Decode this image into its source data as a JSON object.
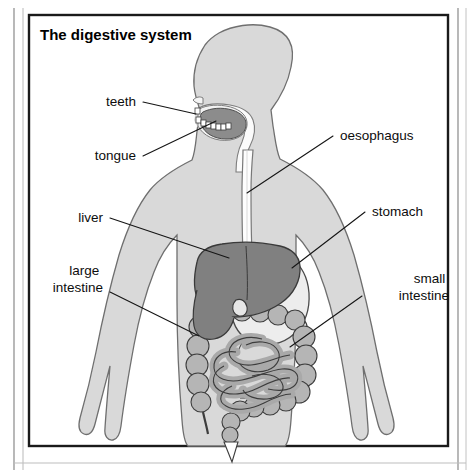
{
  "figure": {
    "title": "The digestive system",
    "background_color": "#ffffff",
    "frame_color": "#1a1a1a",
    "outer_rule_color": "#8a8a8a"
  },
  "palette": {
    "body_fill": "#d9d9d9",
    "body_stroke": "#6f6f6f",
    "liver_fill": "#808080",
    "liver_stroke": "#3a3a3a",
    "stomach_fill": "#ededed",
    "stomach_stroke": "#4a4a4a",
    "oesophagus_fill": "#fdfdfd",
    "oesophagus_stroke": "#787878",
    "intestine_fill": "#b5b5b5",
    "intestine_stroke": "#3d3d3d",
    "small_intestine_fill": "#a9a9a9",
    "tongue_fill": "#8a8a8a",
    "mouth_fill": "#f6f6f6",
    "teeth_fill": "#ffffff",
    "label_color": "#0d0d0d",
    "leader_color": "#151515"
  },
  "labels": [
    {
      "id": "teeth",
      "text": "teeth",
      "lines": [
        "teeth"
      ],
      "anchor": "end",
      "text_x": 136,
      "text_y": 106,
      "leader": [
        [
          143,
          102
        ],
        [
          196,
          114
        ]
      ]
    },
    {
      "id": "tongue",
      "text": "tongue",
      "lines": [
        "tongue"
      ],
      "anchor": "end",
      "text_x": 136,
      "text_y": 160,
      "leader": [
        [
          143,
          156
        ],
        [
          197,
          121
        ]
      ]
    },
    {
      "id": "oesophagus",
      "text": "oesophagus",
      "lines": [
        "oesophagus"
      ],
      "anchor": "start",
      "text_x": 340,
      "text_y": 140,
      "leader": [
        [
          333,
          136
        ],
        [
          247,
          193
        ]
      ]
    },
    {
      "id": "stomach",
      "text": "stomach",
      "lines": [
        "stomach"
      ],
      "anchor": "start",
      "text_x": 372,
      "text_y": 216,
      "leader": [
        [
          365,
          212
        ],
        [
          292,
          268
        ]
      ]
    },
    {
      "id": "liver",
      "text": "liver",
      "lines": [
        "liver"
      ],
      "anchor": "end",
      "text_x": 103,
      "text_y": 222,
      "leader": [
        [
          110,
          218
        ],
        [
          229,
          258
        ]
      ]
    },
    {
      "id": "large-intestine",
      "text": "large intestine",
      "lines": [
        "large",
        "intestine"
      ],
      "anchor": "end",
      "text_x": 103,
      "text_y": 275,
      "leader": [
        [
          110,
          292
        ],
        [
          199,
          336
        ]
      ]
    },
    {
      "id": "small-intestine",
      "text": "small intestine",
      "lines": [
        "small",
        "intestine"
      ],
      "anchor": "end",
      "text_x": 449,
      "text_y": 283,
      "leader": [
        [
          362,
          296
        ],
        [
          290,
          347
        ]
      ]
    }
  ],
  "organs": [
    {
      "id": "body",
      "name": "human body silhouette"
    },
    {
      "id": "head",
      "name": "head in profile"
    },
    {
      "id": "mouth",
      "name": "mouth cavity"
    },
    {
      "id": "teeth",
      "name": "teeth"
    },
    {
      "id": "tongue",
      "name": "tongue"
    },
    {
      "id": "oesophagus",
      "name": "oesophagus"
    },
    {
      "id": "liver",
      "name": "liver"
    },
    {
      "id": "gallbladder",
      "name": "gallbladder"
    },
    {
      "id": "stomach",
      "name": "stomach"
    },
    {
      "id": "large-intestine",
      "name": "large intestine"
    },
    {
      "id": "small-intestine",
      "name": "small intestine"
    },
    {
      "id": "rectum",
      "name": "rectum"
    }
  ]
}
